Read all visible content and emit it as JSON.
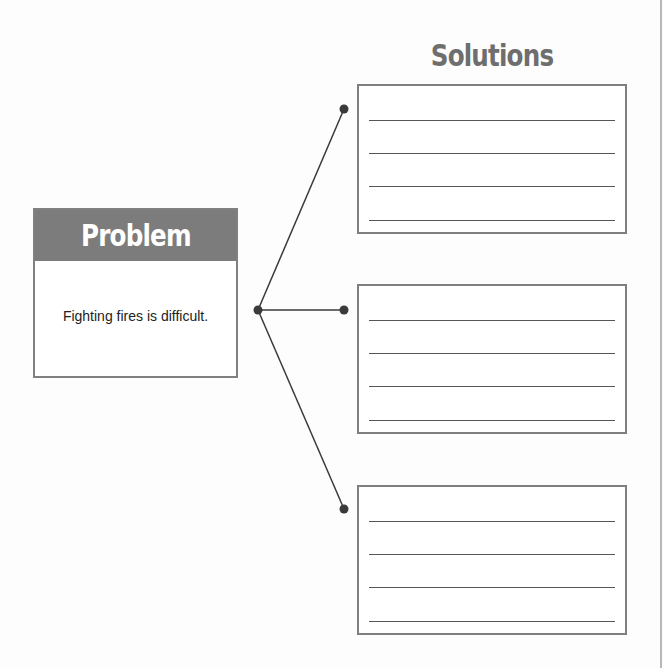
{
  "solutions": {
    "title": "Solutions",
    "boxes": [
      {
        "lines": 4
      },
      {
        "lines": 4
      },
      {
        "lines": 4
      }
    ]
  },
  "problem": {
    "title": "Problem",
    "text": "Fighting fires is difficult."
  },
  "colors": {
    "header_bg": "#7c7c7c",
    "border": "#808080",
    "connector": "#3a3a3a"
  }
}
